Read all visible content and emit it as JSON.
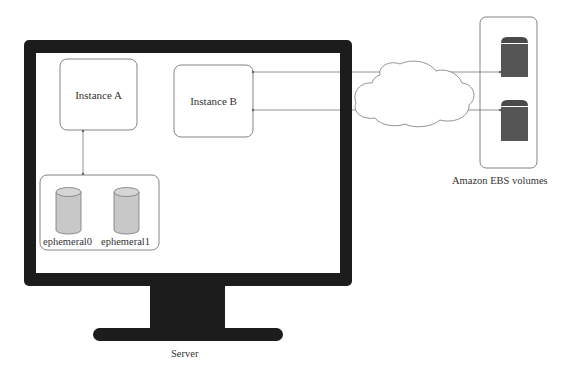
{
  "diagram": {
    "server": {
      "label": "Server"
    },
    "instances": [
      {
        "id": "a",
        "label": "Instance A"
      },
      {
        "id": "b",
        "label": "Instance B"
      }
    ],
    "ephemeral_volumes": [
      {
        "label": "ephemeral0"
      },
      {
        "label": "ephemeral1"
      }
    ],
    "network": {
      "icon": "cloud-icon"
    },
    "ebs": {
      "label": "Amazon EBS volumes",
      "volumes": [
        {
          "icon": "disk-icon"
        },
        {
          "icon": "disk-icon"
        }
      ]
    },
    "colors": {
      "monitor": "#1a1a1a",
      "stroke": "#666666",
      "cylinder_fill": "#c8c8c8",
      "ebs_disk": "#555555",
      "text": "#333333"
    }
  }
}
